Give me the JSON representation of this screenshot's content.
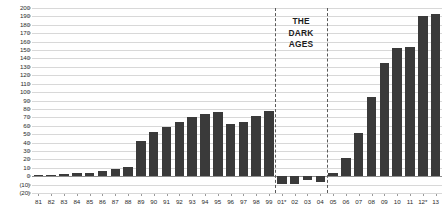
{
  "chart_data": {
    "type": "bar",
    "title": "",
    "xlabel": "",
    "ylabel": "",
    "ylim": [
      -20,
      200
    ],
    "grid": true,
    "legend": false,
    "bar_color": "#3a3a3a",
    "categories": [
      "81",
      "82",
      "83",
      "84",
      "85",
      "86",
      "87",
      "88",
      "89",
      "90",
      "91",
      "92",
      "93",
      "94",
      "95",
      "96",
      "97",
      "98",
      "99",
      "01*",
      "02",
      "03",
      "04",
      "05",
      "06",
      "07",
      "08",
      "09",
      "10",
      "11",
      "12*",
      "13"
    ],
    "values": [
      1,
      1,
      3,
      4,
      4,
      6,
      8,
      11,
      42,
      52,
      58,
      64,
      70,
      74,
      76,
      62,
      64,
      71,
      77,
      -9,
      -9,
      -5,
      -7,
      4,
      22,
      51,
      94,
      135,
      152,
      154,
      191,
      193
    ],
    "ytick_labels": [
      "200",
      "190",
      "180",
      "170",
      "160",
      "150",
      "140",
      "130",
      "120",
      "110",
      "100",
      "90",
      "80",
      "70",
      "60",
      "50",
      "40",
      "30",
      "20",
      "10",
      "0",
      "(10)",
      "(20)"
    ],
    "ytick_values": [
      200,
      190,
      180,
      170,
      160,
      150,
      140,
      130,
      120,
      110,
      100,
      90,
      80,
      70,
      60,
      50,
      40,
      30,
      20,
      10,
      0,
      -10,
      -20
    ],
    "annotations": [
      {
        "name": "dark-ages",
        "text_lines": [
          "THE",
          "DARK",
          "AGES"
        ],
        "start_category": "01*",
        "end_category": "04"
      }
    ]
  }
}
